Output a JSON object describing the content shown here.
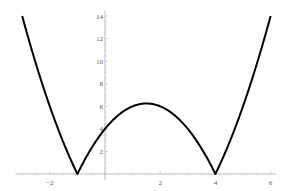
{
  "chart_data": {
    "type": "line",
    "title": "",
    "xlabel": "",
    "ylabel": "",
    "function": "y = |x^2 - 3x - 4|",
    "xlim": [
      -3.1,
      6.2
    ],
    "ylim": [
      0,
      14.5
    ],
    "x_ticks": [
      -2,
      2,
      4,
      6
    ],
    "y_ticks": [
      2,
      4,
      6,
      8,
      10,
      12,
      14
    ],
    "grid": false,
    "legend": null,
    "series": [
      {
        "name": "|x^2 - 3x - 4|",
        "color": "#000000",
        "x": [
          -3,
          -2.5,
          -2,
          -1.5,
          -1,
          -0.5,
          0,
          0.5,
          1,
          1.5,
          2,
          2.5,
          3,
          3.5,
          4,
          4.5,
          5,
          5.5,
          6
        ],
        "values": [
          14,
          9.75,
          6,
          2.75,
          0,
          2.25,
          4,
          5.25,
          6,
          6.25,
          6,
          5.25,
          4,
          2.25,
          0,
          2.75,
          6,
          9.75,
          14
        ]
      }
    ]
  }
}
